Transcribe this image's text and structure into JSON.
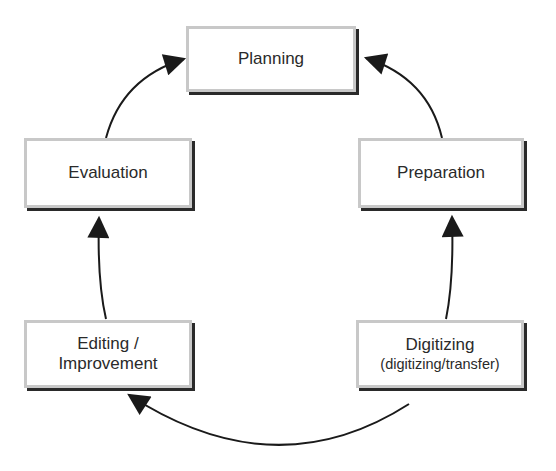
{
  "diagram": {
    "type": "cycle",
    "nodes": [
      {
        "id": "planning",
        "label": "Planning"
      },
      {
        "id": "preparation",
        "label": "Preparation"
      },
      {
        "id": "digitizing",
        "label": "Digitizing",
        "sublabel": "(digitizing/transfer)"
      },
      {
        "id": "editing",
        "label": "Editing /",
        "label2": "Improvement"
      },
      {
        "id": "evaluation",
        "label": "Evaluation"
      }
    ],
    "edges": [
      {
        "from": "preparation",
        "to": "planning"
      },
      {
        "from": "digitizing",
        "to": "preparation"
      },
      {
        "from": "digitizing",
        "to": "editing"
      },
      {
        "from": "editing",
        "to": "evaluation"
      },
      {
        "from": "evaluation",
        "to": "planning"
      }
    ],
    "colors": {
      "border": "#c8c8c8",
      "shadow": "#2a2a2a",
      "arrow": "#1a1a1a",
      "text": "#2a2a2a"
    }
  }
}
